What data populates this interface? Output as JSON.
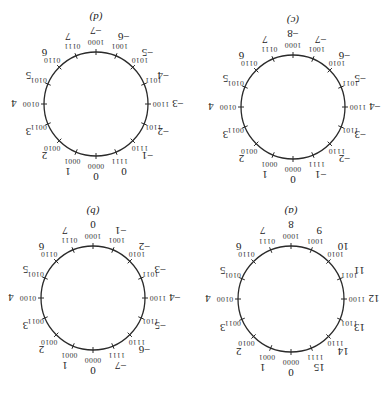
{
  "figure": {
    "orientation_deg": 180,
    "color": "#2a2a2a",
    "panels": [
      {
        "id": "a",
        "title": "(a)",
        "center": [
          96,
          101
        ],
        "radius": 53,
        "binary": [
          "0000",
          "0001",
          "0010",
          "0011",
          "0100",
          "0101",
          "0110",
          "0111",
          "1000",
          "1001",
          "1010",
          "1011",
          "1100",
          "1101",
          "1110",
          "1111"
        ],
        "values": [
          "0",
          "1",
          "2",
          "3",
          "4",
          "5",
          "6",
          "7",
          "8",
          "9",
          "10",
          "11",
          "12",
          "13",
          "14",
          "15"
        ]
      },
      {
        "id": "b",
        "title": "(b)",
        "center": [
          294,
          102
        ],
        "radius": 52,
        "binary": [
          "0000",
          "0001",
          "0010",
          "0011",
          "0100",
          "0101",
          "0110",
          "0111",
          "1000",
          "1001",
          "1010",
          "1011",
          "1100",
          "1101",
          "1110",
          "1111"
        ],
        "values": [
          "0",
          "1",
          "2",
          "3",
          "4",
          "5",
          "6",
          "7",
          "0",
          "−1",
          "−2",
          "−3",
          "−4",
          "−5",
          "−6",
          "−7"
        ]
      },
      {
        "id": "c",
        "title": "(c)",
        "center": [
          94,
          293
        ],
        "radius": 52,
        "binary": [
          "0000",
          "0001",
          "0010",
          "0011",
          "0100",
          "0101",
          "0110",
          "0111",
          "1000",
          "1001",
          "1010",
          "1011",
          "1100",
          "1101",
          "1110",
          "1111"
        ],
        "values": [
          "0",
          "1",
          "2",
          "3",
          "4",
          "5",
          "6",
          "7",
          "−8",
          "−7",
          "−6",
          "−5",
          "−4",
          "−3",
          "−2",
          "−1"
        ]
      },
      {
        "id": "d",
        "title": "(d)",
        "center": [
          291,
          296
        ],
        "radius": 52,
        "binary": [
          "0000",
          "0001",
          "0010",
          "0011",
          "0100",
          "0101",
          "0110",
          "0111",
          "1000",
          "1001",
          "1010",
          "1011",
          "1100",
          "1101",
          "1110",
          "1111"
        ],
        "values": [
          "0",
          "1",
          "2",
          "3",
          "4",
          "5",
          "6",
          "7",
          "−7",
          "−6",
          "−5",
          "−4",
          "−3",
          "−2",
          "−1",
          "0"
        ]
      }
    ]
  }
}
